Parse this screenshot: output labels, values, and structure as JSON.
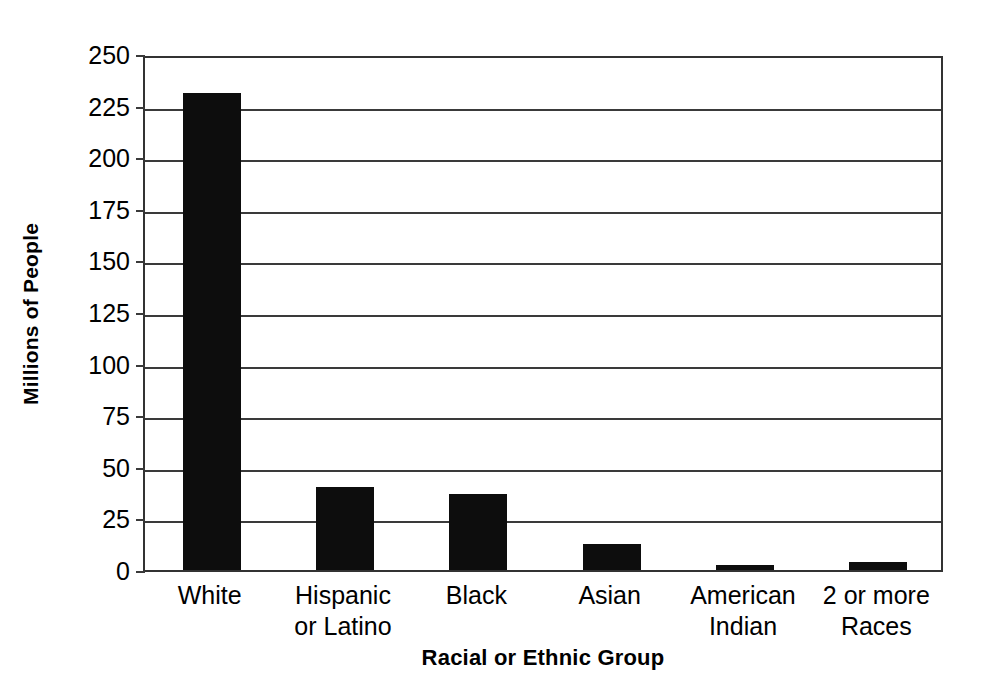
{
  "chart_data": {
    "type": "bar",
    "title": "",
    "xlabel": "Racial or Ethnic Group",
    "ylabel": "Millions of People",
    "categories": [
      "White",
      "Hispanic\nor Latino",
      "Black",
      "Asian",
      "American\nIndian",
      "2 or more\nRaces"
    ],
    "values": [
      231,
      40,
      37,
      12.5,
      2.5,
      4
    ],
    "ylim": [
      0,
      250
    ],
    "yticks": [
      0,
      25,
      50,
      75,
      100,
      125,
      150,
      175,
      200,
      225,
      250
    ],
    "ytick_labels": [
      "0",
      "25",
      "50",
      "75",
      "100",
      "125",
      "150",
      "175",
      "200",
      "225",
      "250"
    ],
    "grid": "horizontal",
    "legend": "none",
    "bar_color": "#0d0d0d",
    "axis_color": "#333333",
    "background_color": "#ffffff"
  }
}
